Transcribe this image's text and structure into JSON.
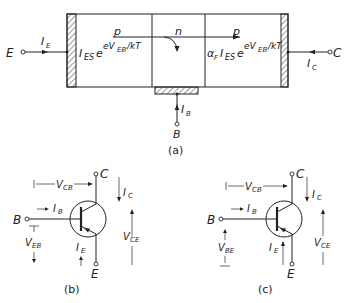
{
  "figure_a": {
    "caption": "(a)",
    "terminals": {
      "emitter": "E",
      "collector": "C",
      "base": "B"
    },
    "currents": {
      "emitter": "I",
      "emitter_sub": "E",
      "collector": "I",
      "collector_sub": "C",
      "base": "I",
      "base_sub": "B"
    },
    "regions": {
      "left": "p",
      "middle": "n",
      "right": "p"
    },
    "emitter_current_expr": {
      "main": "I",
      "sub": "ES",
      "e": "e",
      "exp": "eV",
      "exp_sub": "EB",
      "exp_tail": "/kT"
    },
    "collector_current_expr": {
      "alpha": "α",
      "alpha_sub": "F",
      "main": "I",
      "sub": "ES",
      "e": "e",
      "exp": "eV",
      "exp_sub": "EB",
      "exp_tail": "/kT"
    }
  },
  "figure_b": {
    "caption": "(b)",
    "terminals": {
      "base": "B",
      "collector": "C",
      "emitter": "E"
    },
    "labels": {
      "vcb": "V",
      "vcb_sub": "CB",
      "ib": "I",
      "ib_sub": "B",
      "ic": "I",
      "ic_sub": "C",
      "ie": "I",
      "ie_sub": "E",
      "veb": "V",
      "veb_sub": "EB",
      "vce": "V",
      "vce_sub": "CE"
    }
  },
  "figure_c": {
    "caption": "(c)",
    "terminals": {
      "base": "B",
      "collector": "C",
      "emitter": "E"
    },
    "labels": {
      "vcb": "V",
      "vcb_sub": "CB",
      "ib": "I",
      "ib_sub": "B",
      "ic": "I",
      "ic_sub": "C",
      "ie": "I",
      "ie_sub": "E",
      "vbe": "V",
      "vbe_sub": "BE",
      "vce": "V",
      "vce_sub": "CE"
    }
  }
}
